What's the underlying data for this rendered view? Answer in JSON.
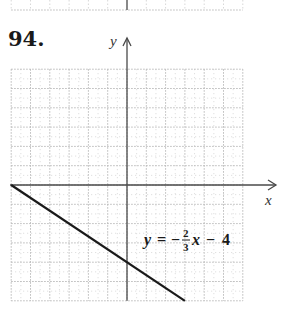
{
  "problem": {
    "number": "94."
  },
  "chart_data": {
    "type": "line",
    "title": "",
    "xlabel": "x",
    "ylabel": "y",
    "xlim": [
      -6,
      6
    ],
    "ylim": [
      -6,
      6
    ],
    "grid": true,
    "grid_spacing": 1,
    "series": [
      {
        "name": "y = -2/3x - 4",
        "slope": -0.6667,
        "intercept": -4,
        "x": [
          -6,
          3
        ],
        "y": [
          0,
          -6
        ]
      }
    ],
    "annotations": [
      {
        "text": "y = -2/3 x - 4",
        "x": 1,
        "y": -2.7
      }
    ]
  },
  "equation_label": {
    "lhs": "y",
    "equals": "=",
    "sign": "−",
    "numerator": "2",
    "denominator": "3",
    "var": "x",
    "minus": "−",
    "constant": "4"
  },
  "colors": {
    "axis": "#4a4a4a",
    "line": "#1a1a1a",
    "grid": "#b8b8b8",
    "grid_minor": "#d8d8d8"
  }
}
